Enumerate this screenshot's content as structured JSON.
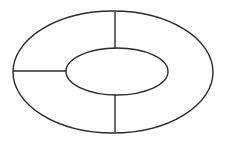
{
  "figure": {
    "title": "Annulus divided into three sectors",
    "type": "geometric-diagram",
    "background_color": "#ffffff",
    "stroke_color": "#2b2b2b",
    "stroke_width": 1.4,
    "canvas": {
      "width": 237,
      "height": 141
    },
    "shapes": {
      "outer_ellipse": {
        "name": "outer-ellipse",
        "cx": 113,
        "cy": 72,
        "rx": 100,
        "ry": 61,
        "left": 13,
        "right": 213,
        "top": 11,
        "bottom": 133
      },
      "inner_ellipse": {
        "name": "inner-ellipse",
        "cx": 117,
        "cy": 71.5,
        "rx": 51,
        "ry": 23.5,
        "left": 66,
        "right": 168,
        "top": 48,
        "bottom": 95
      }
    },
    "spokes": [
      {
        "name": "left-horizontal-spoke",
        "orientation": "horizontal",
        "x1": 13,
        "y1": 71,
        "x2": 66,
        "y2": 71
      },
      {
        "name": "top-vertical-spoke",
        "orientation": "vertical",
        "x1": 115,
        "y1": 12,
        "x2": 115,
        "y2": 49
      },
      {
        "name": "bottom-vertical-spoke",
        "orientation": "vertical",
        "x1": 115,
        "y1": 95,
        "x2": 115,
        "y2": 132
      }
    ],
    "sector_count": 3
  }
}
